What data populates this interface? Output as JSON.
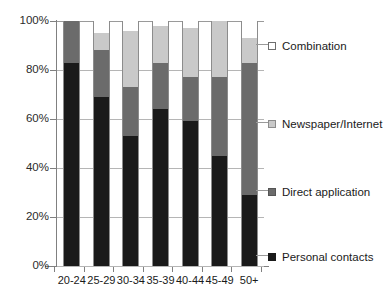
{
  "chart_data": {
    "type": "bar",
    "stacked": true,
    "stack_mode": "percent",
    "title": "",
    "xlabel": "",
    "ylabel": "",
    "ylim": [
      0,
      100
    ],
    "yticks": [
      0,
      20,
      40,
      60,
      80,
      100
    ],
    "ytick_labels": [
      "0%",
      "20%",
      "40%",
      "60%",
      "80%",
      "100%"
    ],
    "grid": true,
    "legend_position": "right",
    "categories": [
      "20-24",
      "25-29",
      "30-34",
      "35-39",
      "40-44",
      "45-49",
      "50+"
    ],
    "series": [
      {
        "name": "Personal contacts",
        "color": "#1a1a1a",
        "values": [
          83,
          69,
          53,
          64,
          59,
          45,
          29
        ]
      },
      {
        "name": "Direct application",
        "color": "#6b6b6b",
        "values": [
          17,
          19,
          20,
          19,
          18,
          32,
          54
        ]
      },
      {
        "name": "Newspaper/Internet",
        "color": "#c9c9c9",
        "values": [
          0,
          7,
          23,
          15,
          20,
          23,
          10
        ]
      },
      {
        "name": "Combination",
        "color": "#ffffff",
        "values": [
          0,
          5,
          4,
          2,
          3,
          0,
          7
        ]
      }
    ]
  },
  "legend": {
    "items": [
      {
        "label": "Combination",
        "swatch": "comb"
      },
      {
        "label": "Newspaper/Internet",
        "swatch": "news"
      },
      {
        "label": "Direct application",
        "swatch": "direct"
      },
      {
        "label": "Personal contacts",
        "swatch": "personal"
      }
    ]
  }
}
